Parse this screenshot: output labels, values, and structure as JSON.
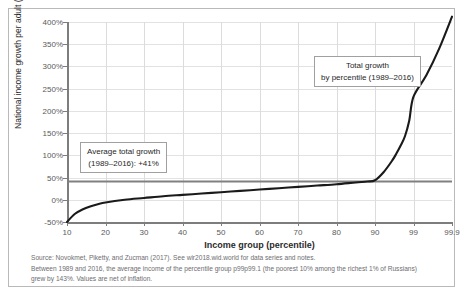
{
  "chart_data": {
    "type": "line",
    "title": "",
    "xlabel": "Income group (percentile)",
    "ylabel": "National income growth per adult (%)",
    "xticklabels": [
      "10",
      "20",
      "30",
      "40",
      "50",
      "60",
      "70",
      "80",
      "90",
      "99",
      "99.9"
    ],
    "yticklabels": [
      "400%",
      "350%",
      "300%",
      "250%",
      "200%",
      "150%",
      "100%",
      "50%",
      "0%",
      "-50%"
    ],
    "ylim": [
      -50,
      400
    ],
    "ytick_values": [
      400,
      350,
      300,
      250,
      200,
      150,
      100,
      50,
      0,
      -50
    ],
    "grid": true,
    "legend": "none",
    "series": [
      {
        "name": "Total growth by percentile (1989-2016)",
        "color": "#1a1a1a",
        "x": [
          10,
          12,
          14,
          16,
          18,
          20,
          25,
          30,
          35,
          40,
          45,
          50,
          55,
          60,
          65,
          70,
          75,
          80,
          85,
          88,
          90,
          92,
          94,
          95,
          96,
          97,
          98,
          99,
          99.3,
          99.6,
          99.9
        ],
        "values": [
          -50,
          -32,
          -22,
          -15,
          -10,
          -6,
          0,
          4,
          8,
          11,
          14,
          17,
          20,
          23,
          26,
          29,
          32,
          35,
          39,
          41,
          44,
          62,
          88,
          104,
          122,
          143,
          178,
          232,
          280,
          340,
          412
        ]
      },
      {
        "name": "Average total growth (1989-2016)",
        "color": "#808080",
        "constant_value": 41,
        "style": "horizontal-line"
      }
    ],
    "annotations": [
      {
        "name": "average-total-growth",
        "line1": "Average total growth",
        "line2": "(1989–2016): +41%"
      },
      {
        "name": "total-growth-by-percentile",
        "line1": "Total growth",
        "line2": "by percentile (1989–2016)"
      }
    ]
  },
  "footnotes": [
    "Source: Novokmet, Piketty, and Zucman (2017). See wir2018.wid.world for data series and notes.",
    "Between 1989 and 2016, the average income of the percentile group p99p99.1 (the poorest 10% among the richest 1% of Russians)",
    "grew by 143%. Values are net of inflation."
  ],
  "colors": {
    "series_line": "#1a1a1a",
    "average_line": "#808080",
    "axis": "#7d7d7d",
    "grid": "#dcdcdc",
    "tick_text": "#59595b",
    "frame": "#b9b9b9"
  }
}
